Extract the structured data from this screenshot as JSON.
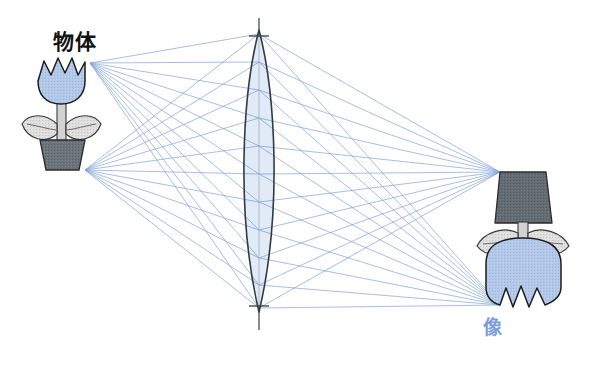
{
  "diagram": {
    "kind": "optics-ray-diagram",
    "title_object": "物体",
    "title_image": "像",
    "labels": {
      "object": "物体",
      "image": "像"
    },
    "colors": {
      "ray": "#7d9fd4",
      "ray_light": "#a8c0e4",
      "petal_fill": "#aec4e8",
      "petal_stroke": "#2b2b2b",
      "leaf_fill": "#dcdcdc",
      "leaf_stroke": "#3a3a3a",
      "stem_fill": "#d2d2d2",
      "pot_fill": "#666e75",
      "pot_fill_image": "#5c646c",
      "pot_stroke": "#2b2b2b",
      "lens_fill": "#dae6f5",
      "lens_stroke": "#333b42",
      "axis_line": "#555b60",
      "image_label_color": "#7b9ddb",
      "object_label_color": "#121212",
      "background": "#ffffff"
    },
    "optics": {
      "lens_center_x": 259,
      "lens_top_y": 30,
      "lens_bottom_y": 312,
      "lens_half_width": 22,
      "axis_top_y": 18,
      "axis_bottom_y": 330,
      "object_top_point": [
        90,
        63
      ],
      "object_base_point": [
        85,
        170
      ],
      "image_top_point": [
        500,
        172
      ],
      "image_base_point": [
        500,
        305
      ],
      "ray_count_per_point": 11
    },
    "object_flower": {
      "bloom_center": [
        62,
        82
      ],
      "pot_label": "flower-pot",
      "parts": [
        "bloom",
        "stem",
        "leaf-left",
        "leaf-right",
        "pot"
      ]
    },
    "image_flower": {
      "inverted": true,
      "bloom_center": [
        523,
        270
      ],
      "parts": [
        "pot",
        "leaf-left",
        "leaf-right",
        "stem",
        "bloom"
      ]
    }
  }
}
